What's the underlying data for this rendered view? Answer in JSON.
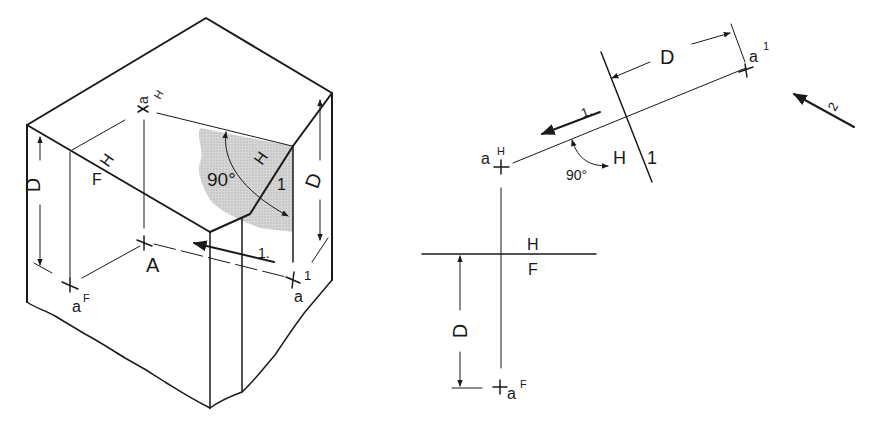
{
  "figure": {
    "left_view": {
      "type": "pictorial-block",
      "labels": {
        "point_a_H": "a",
        "point_a_H_sup": "H",
        "point_A": "A",
        "point_a_F": "a",
        "point_a_F_sup": "F",
        "point_a_1": "a",
        "point_a_1_sup": "1",
        "fold_H": "H",
        "fold_F": "F",
        "fold_H2": "H",
        "fold_1": "1",
        "angle": "90°",
        "dim_left": "D",
        "dim_right": "D",
        "sight_arrow": "1."
      },
      "shade_color": "#cfcfcf"
    },
    "right_view": {
      "type": "orthographic-projection",
      "labels": {
        "point_a_H": "a",
        "point_a_H_sup": "H",
        "point_a_1": "a",
        "point_a_1_sup": "1",
        "point_a_F": "a",
        "point_a_F_sup": "F",
        "fold_HF_top": "H",
        "fold_HF_bottom": "F",
        "fold_H1_H": "H",
        "fold_H1_1": "1",
        "angle": "90°",
        "dim_top": "D",
        "dim_bottom": "D",
        "sight_arrow_1": "1.",
        "sight_arrow_2": "2"
      }
    }
  }
}
